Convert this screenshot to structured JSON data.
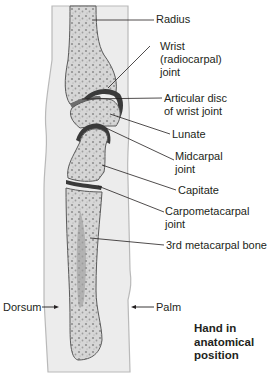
{
  "figure": {
    "title": "Hand in anatomical position",
    "caption_lines": [
      "Hand in",
      "anatomical",
      "position"
    ]
  },
  "labels": {
    "radius": "Radius",
    "wrist_joint": [
      "Wrist",
      "(radiocarpal)",
      "joint"
    ],
    "articular_disc": [
      "Articular disc",
      "of wrist joint"
    ],
    "lunate": "Lunate",
    "midcarpal_joint": [
      "Midcarpal",
      "joint"
    ],
    "capitate": "Capitate",
    "carpometacarpal_joint": [
      "Carpometacarpal",
      "joint"
    ],
    "third_metacarpal": "3rd metacarpal bone",
    "dorsum": "Dorsum",
    "palm": "Palm"
  },
  "colors": {
    "soft_tissue": "#ececec",
    "soft_tissue_edge": "#b9b9b9",
    "bone_fill": "#d9d9d9",
    "bone_edge": "#5a5a5a",
    "cartilage": "#3a3a3a",
    "marrow_dots": "#8a8a8a",
    "leader_line": "#231f20"
  }
}
